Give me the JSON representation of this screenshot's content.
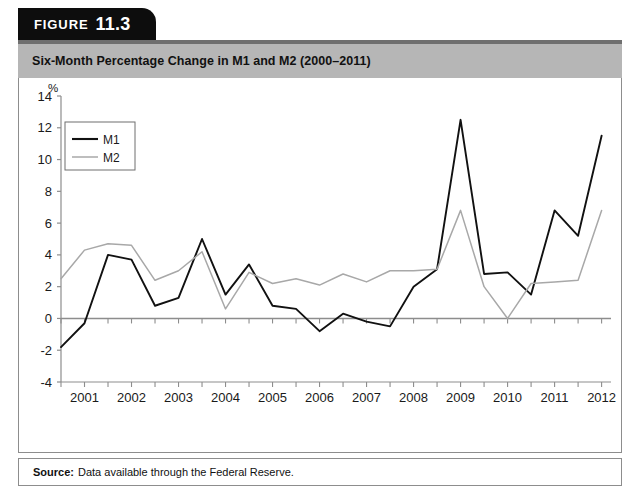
{
  "figure": {
    "tab_word": "FIGURE",
    "tab_number": "11.3",
    "title": "Six-Month Percentage Change in M1 and M2 (2000–2011)",
    "source_label": "Source:",
    "source_text": "Data available through the Federal Reserve."
  },
  "colors": {
    "tab_background": "#0d0d0d",
    "title_background": "#b6b6b6",
    "title_top_rule": "#6f6f6f",
    "panel_border": "#8d8d8d",
    "m1_line": "#111111",
    "m2_line": "#a8a8a8",
    "axis": "#8d8d8d",
    "text": "#111111"
  },
  "chart_data": {
    "type": "line",
    "title": "Six-Month Percentage Change in M1 and M2 (2000–2011)",
    "xlabel": "",
    "ylabel": "%",
    "ylim": [
      -4,
      14
    ],
    "ytick_labels": [
      "14",
      "12",
      "10",
      "8",
      "6",
      "4",
      "2",
      "0",
      "-2",
      "-4"
    ],
    "ytick_values": [
      14,
      12,
      10,
      8,
      6,
      4,
      2,
      0,
      -2,
      -4
    ],
    "xtick_labels": [
      "2001",
      "2002",
      "2003",
      "2004",
      "2005",
      "2006",
      "2007",
      "2008",
      "2009",
      "2010",
      "2011",
      "2012"
    ],
    "xtick_values": [
      2001,
      2002,
      2003,
      2004,
      2005,
      2006,
      2007,
      2008,
      2009,
      2010,
      2011,
      2012
    ],
    "xlim": [
      2000.5,
      2012.2
    ],
    "x": [
      2000.5,
      2001.0,
      2001.5,
      2002.0,
      2002.5,
      2003.0,
      2003.5,
      2004.0,
      2004.5,
      2005.0,
      2005.5,
      2006.0,
      2006.5,
      2007.0,
      2007.5,
      2008.0,
      2008.5,
      2009.0,
      2009.5,
      2010.0,
      2010.5,
      2011.0,
      2011.5,
      2012.0
    ],
    "grid": false,
    "legend_position": "upper-left",
    "legend_entries": [
      "M1",
      "M2"
    ],
    "series": [
      {
        "name": "M1",
        "color": "#111111",
        "values": [
          -1.8,
          -0.3,
          4.0,
          3.7,
          0.8,
          1.3,
          5.0,
          1.5,
          3.4,
          0.8,
          0.6,
          -0.8,
          0.3,
          -0.2,
          -0.5,
          2.0,
          3.1,
          12.5,
          2.8,
          2.9,
          1.5,
          6.8,
          5.2,
          11.5
        ]
      },
      {
        "name": "M2",
        "color": "#a8a8a8",
        "values": [
          2.5,
          4.3,
          4.7,
          4.6,
          2.4,
          3.0,
          4.2,
          0.6,
          2.9,
          2.2,
          2.5,
          2.1,
          2.8,
          2.3,
          3.0,
          3.0,
          3.1,
          6.8,
          2.0,
          0.0,
          2.2,
          2.3,
          2.4,
          6.8
        ]
      }
    ]
  }
}
